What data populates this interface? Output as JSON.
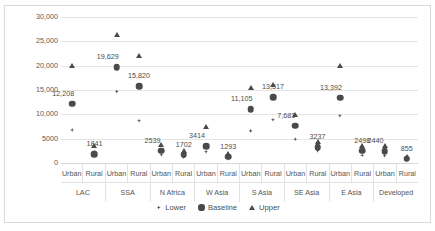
{
  "chart_data": {
    "type": "scatter",
    "title": "",
    "xlabel": "",
    "ylabel": "US$ Billion, Annual",
    "ylim": [
      0,
      30000
    ],
    "yticks": [
      0,
      5000,
      10000,
      15000,
      20000,
      25000,
      30000
    ],
    "ytick_labels": [
      "0",
      "5000",
      "10,000",
      "15,000",
      "20,000",
      "25,000",
      "30,000"
    ],
    "grid": true,
    "legend_position": "bottom",
    "legend": [
      "Lower",
      "Baseline",
      "Upper"
    ],
    "groups": [
      "LAC",
      "SSA",
      "N Africa",
      "W Asia",
      "S Asia",
      "SE Asia",
      "E Asia",
      "Developed"
    ],
    "subcategories": [
      "Urban",
      "Rural"
    ],
    "categories": [
      "LAC Urban",
      "LAC Rural",
      "SSA Urban",
      "SSA Rural",
      "N Africa Urban",
      "N Africa Rural",
      "W Asia Urban",
      "W Asia Rural",
      "S Asia Urban",
      "S Asia Rural",
      "SE Asia Urban",
      "SE Asia Rural",
      "E Asia Urban",
      "E Asia Rural",
      "Developed Urban",
      "Developed Rural"
    ],
    "series": [
      {
        "name": "Lower",
        "marker": "diamond",
        "values": [
          6800,
          2300,
          14700,
          8700,
          1700,
          1200,
          2300,
          900,
          6600,
          8900,
          4900,
          2500,
          9700,
          1600,
          1500,
          600
        ]
      },
      {
        "name": "Baseline",
        "marker": "circle",
        "values": [
          12208,
          1841,
          19629,
          15820,
          2539,
          1702,
          3414,
          1293,
          11105,
          13517,
          7681,
          3237,
          13392,
          2498,
          2440,
          855
        ]
      },
      {
        "name": "Upper",
        "marker": "triangle",
        "values": [
          19900,
          3400,
          26200,
          22000,
          3800,
          2500,
          7400,
          1900,
          15500,
          16100,
          9900,
          4400,
          19900,
          3500,
          3400,
          1300
        ]
      }
    ],
    "data_labels": [
      {
        "category": "LAC Urban",
        "text": "12,208"
      },
      {
        "category": "LAC Rural",
        "text": "1841"
      },
      {
        "category": "SSA Urban",
        "text": "19,629"
      },
      {
        "category": "SSA Rural",
        "text": "15,820"
      },
      {
        "category": "N Africa Urban",
        "text": "2539"
      },
      {
        "category": "N Africa Rural",
        "text": "1702"
      },
      {
        "category": "W Asia Urban",
        "text": "3414"
      },
      {
        "category": "W Asia Rural",
        "text": "1293"
      },
      {
        "category": "S Asia Urban",
        "text": "11,105"
      },
      {
        "category": "S Asia Rural",
        "text": "13,517"
      },
      {
        "category": "SE Asia Urban",
        "text": "7,681"
      },
      {
        "category": "SE Asia Rural",
        "text": "3237"
      },
      {
        "category": "E Asia Urban",
        "text": "13,392"
      },
      {
        "category": "E Asia Rural",
        "text": "2498"
      },
      {
        "category": "Developed Urban",
        "text": "2440"
      },
      {
        "category": "Developed Rural",
        "text": "855"
      }
    ],
    "colors": {
      "marker": "#4a4a4a",
      "gridline": "#e4e4e4",
      "frame": "#d9d9d9",
      "text": "#555555",
      "background": "#ffffff"
    }
  },
  "axis": {
    "y_title": "US$ Billion, Annual"
  },
  "legend": {
    "lower_label": "Lower",
    "baseline_label": "Baseline",
    "upper_label": "Upper"
  }
}
